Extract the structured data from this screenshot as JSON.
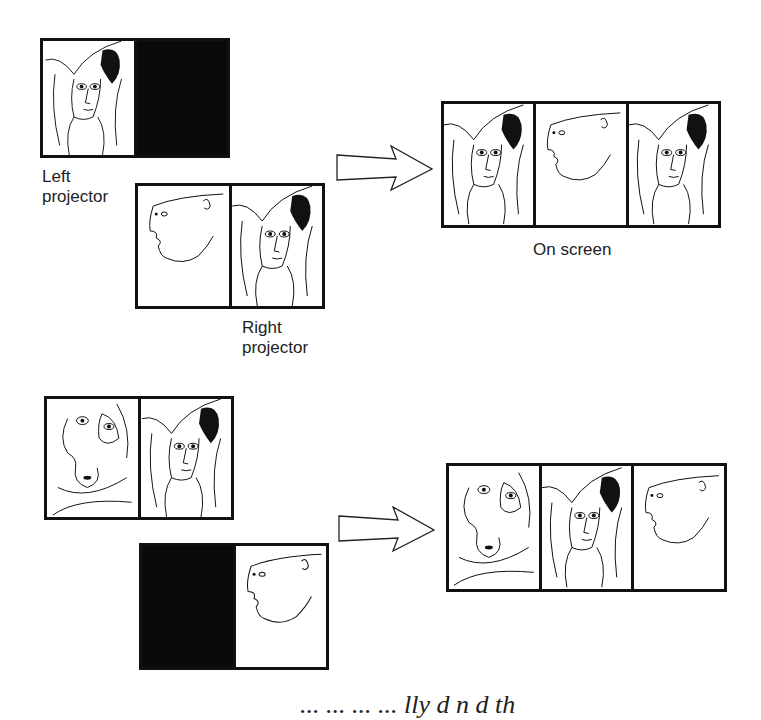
{
  "section_top": {
    "left_projector": {
      "label": "Left projector",
      "cells": [
        "woman-face",
        "black"
      ]
    },
    "right_projector": {
      "label": "Right projector",
      "cells": [
        "profile-face",
        "woman-face"
      ]
    },
    "on_screen": {
      "label": "On screen",
      "cells": [
        "woman-face",
        "profile-face",
        "woman-face"
      ]
    }
  },
  "section_bottom": {
    "left_projector": {
      "cells": [
        "abstract-face",
        "woman-face"
      ]
    },
    "right_projector": {
      "cells": [
        "black",
        "profile-face"
      ]
    },
    "on_screen": {
      "cells": [
        "abstract-face",
        "woman-face",
        "profile-face"
      ]
    }
  },
  "labels": {
    "left": "Left",
    "projector": "projector",
    "right": "Right",
    "on_screen": "On screen"
  },
  "footer_cutoff_text": "...      ...      ...      ...   lly   d  n  d  th"
}
